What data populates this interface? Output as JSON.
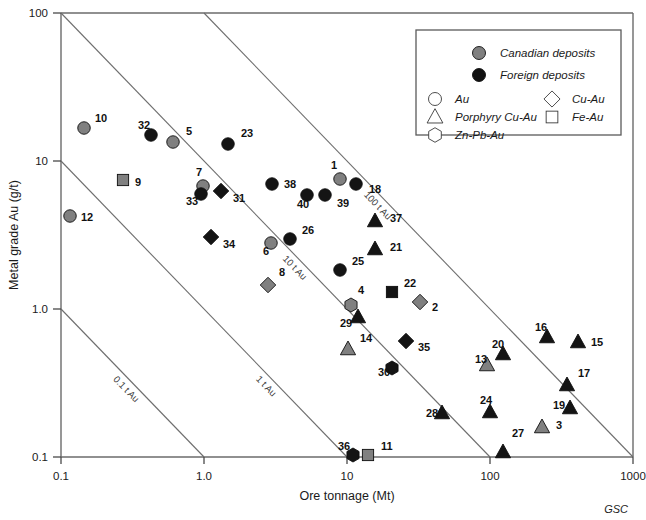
{
  "figure": {
    "credit": "GSC"
  },
  "axes": {
    "xlabel": "Ore tonnage (Mt)",
    "ylabel": "Metal grade Au (g/t)",
    "xticks": [
      "0.1",
      "1.0",
      "10",
      "100",
      "1000"
    ],
    "yticks": [
      "100",
      "10",
      "1.0",
      "0.1"
    ]
  },
  "legend": {
    "fill_entries": [
      {
        "label": "Canadian deposits",
        "marker": "circle",
        "color": "#808080"
      },
      {
        "label": "Foreign deposits",
        "marker": "circle",
        "color": "#111111"
      }
    ],
    "shape_entries_left": [
      {
        "label": "Au",
        "marker": "circle"
      },
      {
        "label": "Porphyry Cu-Au",
        "marker": "triangle"
      },
      {
        "label": "Zn-Pb-Au",
        "marker": "hexagon"
      }
    ],
    "shape_entries_right": [
      {
        "label": "Cu-Au",
        "marker": "diamond"
      },
      {
        "label": "Fe-Au",
        "marker": "square"
      }
    ]
  },
  "chart_data": {
    "type": "scatter",
    "title": "",
    "xlabel": "Ore tonnage (Mt)",
    "ylabel": "Metal grade Au (g/t)",
    "xscale": "log",
    "yscale": "log",
    "xlim": [
      0.1,
      1000
    ],
    "ylim": [
      0.1,
      100
    ],
    "grid": false,
    "legend_position": "top-right",
    "annotations": [
      {
        "text": "0.1 t Au",
        "contour_value": 0.1
      },
      {
        "text": "1 t Au",
        "contour_value": 1
      },
      {
        "text": "10 t Au",
        "contour_value": 10
      },
      {
        "text": "100 t Au",
        "contour_value": 100
      }
    ],
    "iso_contours": [
      0.1,
      1,
      10,
      100
    ],
    "series": [
      {
        "name": "Canadian deposits",
        "color": "#808080"
      },
      {
        "name": "Foreign deposits",
        "color": "#111111"
      }
    ],
    "points": [
      {
        "id": "10",
        "x": 0.22,
        "y": 16.0,
        "marker": "circle",
        "origin": "Canadian",
        "px": 84,
        "py": 128,
        "lx": 95,
        "ly": 122
      },
      {
        "id": "12",
        "x": 0.13,
        "y": 4.4,
        "marker": "circle",
        "origin": "Canadian",
        "px": 70,
        "py": 216,
        "lx": 81,
        "ly": 221
      },
      {
        "id": "9",
        "x": 0.31,
        "y": 6.6,
        "marker": "square",
        "origin": "Canadian",
        "px": 123,
        "py": 180,
        "lx": 135,
        "ly": 186
      },
      {
        "id": "32",
        "x": 0.52,
        "y": 13.8,
        "marker": "circle",
        "origin": "Foreign",
        "px": 151,
        "py": 135,
        "lx": 138,
        "ly": 129
      },
      {
        "id": "5",
        "x": 0.73,
        "y": 12.4,
        "marker": "circle",
        "origin": "Canadian",
        "px": 173,
        "py": 142,
        "lx": 186,
        "ly": 135
      },
      {
        "id": "23",
        "x": 1.4,
        "y": 12.0,
        "marker": "circle",
        "origin": "Foreign",
        "px": 228,
        "py": 144,
        "lx": 241,
        "ly": 137
      },
      {
        "id": "7",
        "x": 1.05,
        "y": 5.8,
        "marker": "circle",
        "origin": "Canadian",
        "px": 203,
        "py": 186,
        "lx": 196,
        "ly": 176
      },
      {
        "id": "33",
        "x": 1.05,
        "y": 5.1,
        "marker": "circle",
        "origin": "Foreign",
        "px": 201,
        "py": 194,
        "lx": 186,
        "ly": 205
      },
      {
        "id": "31",
        "x": 1.2,
        "y": 5.4,
        "marker": "diamond",
        "origin": "Foreign",
        "px": 221,
        "py": 191,
        "lx": 233,
        "ly": 202
      },
      {
        "id": "34",
        "x": 1.1,
        "y": 3.0,
        "marker": "diamond",
        "origin": "Foreign",
        "px": 211,
        "py": 237,
        "lx": 223,
        "ly": 248
      },
      {
        "id": "38",
        "x": 2.7,
        "y": 5.9,
        "marker": "circle",
        "origin": "Foreign",
        "px": 272,
        "py": 184,
        "lx": 284,
        "ly": 188
      },
      {
        "id": "6",
        "x": 3.4,
        "y": 2.9,
        "marker": "circle",
        "origin": "Canadian",
        "px": 271,
        "py": 243,
        "lx": 263,
        "ly": 255
      },
      {
        "id": "26",
        "x": 4.0,
        "y": 3.0,
        "marker": "circle",
        "origin": "Foreign",
        "px": 290,
        "py": 239,
        "lx": 302,
        "ly": 234
      },
      {
        "id": "8",
        "x": 2.6,
        "y": 1.35,
        "marker": "diamond",
        "origin": "Canadian",
        "px": 268,
        "py": 285,
        "lx": 279,
        "ly": 276
      },
      {
        "id": "40",
        "x": 6.0,
        "y": 5.0,
        "marker": "circle",
        "origin": "Foreign",
        "px": 307,
        "py": 195,
        "lx": 297,
        "ly": 208
      },
      {
        "id": "39",
        "x": 7.0,
        "y": 5.0,
        "marker": "circle",
        "origin": "Foreign",
        "px": 325,
        "py": 195,
        "lx": 337,
        "ly": 207
      },
      {
        "id": "1",
        "x": 9.0,
        "y": 6.4,
        "marker": "circle",
        "origin": "Canadian",
        "px": 340,
        "py": 179,
        "lx": 331,
        "ly": 169
      },
      {
        "id": "18",
        "x": 11.0,
        "y": 6.0,
        "marker": "circle",
        "origin": "Foreign",
        "px": 356,
        "py": 184,
        "lx": 369,
        "ly": 193
      },
      {
        "id": "37",
        "x": 18.0,
        "y": 3.4,
        "marker": "triangle",
        "origin": "Foreign",
        "px": 375,
        "py": 221,
        "lx": 390,
        "ly": 222
      },
      {
        "id": "21",
        "x": 20.0,
        "y": 2.6,
        "marker": "triangle",
        "origin": "Foreign",
        "px": 375,
        "py": 249,
        "lx": 390,
        "ly": 251
      },
      {
        "id": "25",
        "x": 10.0,
        "y": 1.7,
        "marker": "circle",
        "origin": "Foreign",
        "px": 340,
        "py": 270,
        "lx": 352,
        "ly": 265
      },
      {
        "id": "22",
        "x": 24.0,
        "y": 1.25,
        "marker": "square",
        "origin": "Foreign",
        "px": 392,
        "py": 292,
        "lx": 404,
        "ly": 287
      },
      {
        "id": "2",
        "x": 32.0,
        "y": 1.05,
        "marker": "diamond",
        "origin": "Canadian",
        "px": 420,
        "py": 302,
        "lx": 432,
        "ly": 311
      },
      {
        "id": "4",
        "x": 9.5,
        "y": 1.0,
        "marker": "hexagon",
        "origin": "Canadian",
        "px": 351,
        "py": 305,
        "lx": 358,
        "ly": 294
      },
      {
        "id": "29",
        "x": 10.5,
        "y": 0.83,
        "marker": "triangle",
        "origin": "Foreign",
        "px": 358,
        "py": 317,
        "lx": 340,
        "ly": 327
      },
      {
        "id": "35",
        "x": 23.0,
        "y": 0.87,
        "marker": "diamond",
        "origin": "Foreign",
        "px": 406,
        "py": 341,
        "lx": 418,
        "ly": 351
      },
      {
        "id": "14",
        "x": 9.0,
        "y": 0.62,
        "marker": "triangle",
        "origin": "Canadian",
        "px": 348,
        "py": 349,
        "lx": 360,
        "ly": 342
      },
      {
        "id": "30",
        "x": 15.0,
        "y": 0.41,
        "marker": "hexagon",
        "origin": "Foreign",
        "px": 392,
        "py": 368,
        "lx": 378,
        "ly": 376
      },
      {
        "id": "13",
        "x": 82.0,
        "y": 0.46,
        "marker": "triangle",
        "origin": "Canadian",
        "px": 487,
        "py": 365,
        "lx": 475,
        "ly": 363
      },
      {
        "id": "20",
        "x": 100.0,
        "y": 0.56,
        "marker": "triangle",
        "origin": "Foreign",
        "px": 503,
        "py": 354,
        "lx": 492,
        "ly": 348
      },
      {
        "id": "16",
        "x": 240.0,
        "y": 0.72,
        "marker": "triangle",
        "origin": "Foreign",
        "px": 547,
        "py": 337,
        "lx": 535,
        "ly": 331
      },
      {
        "id": "15",
        "x": 330.0,
        "y": 0.66,
        "marker": "triangle",
        "origin": "Foreign",
        "px": 578,
        "py": 342,
        "lx": 591,
        "ly": 346
      },
      {
        "id": "17",
        "x": 260.0,
        "y": 0.34,
        "marker": "triangle",
        "origin": "Foreign",
        "px": 567,
        "py": 385,
        "lx": 578,
        "ly": 377
      },
      {
        "id": "19",
        "x": 290.0,
        "y": 0.25,
        "marker": "triangle",
        "origin": "Foreign",
        "px": 570,
        "py": 408,
        "lx": 553,
        "ly": 409
      },
      {
        "id": "24",
        "x": 86.0,
        "y": 0.22,
        "marker": "triangle",
        "origin": "Foreign",
        "px": 490,
        "py": 412,
        "lx": 480,
        "ly": 404
      },
      {
        "id": "28",
        "x": 38.0,
        "y": 0.21,
        "marker": "triangle",
        "origin": "Foreign",
        "px": 442,
        "py": 413,
        "lx": 426,
        "ly": 417
      },
      {
        "id": "3",
        "x": 270.0,
        "y": 0.19,
        "marker": "triangle",
        "origin": "Canadian",
        "px": 542,
        "py": 427,
        "lx": 556,
        "ly": 429
      },
      {
        "id": "27",
        "x": 100.0,
        "y": 0.1,
        "marker": "triangle",
        "origin": "Foreign",
        "px": 503,
        "py": 452,
        "lx": 512,
        "ly": 437
      },
      {
        "id": "36",
        "x": 11.5,
        "y": 0.1,
        "marker": "hexagon",
        "origin": "Foreign",
        "px": 353,
        "py": 455,
        "lx": 338,
        "ly": 450
      },
      {
        "id": "11",
        "x": 13.5,
        "y": 0.1,
        "marker": "square",
        "origin": "Canadian",
        "px": 368,
        "py": 455,
        "lx": 381,
        "ly": 450
      }
    ]
  }
}
